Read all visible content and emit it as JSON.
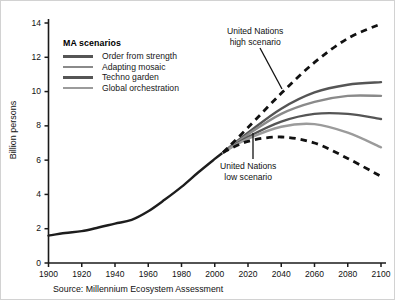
{
  "chart_data": {
    "type": "line",
    "title": "",
    "xlabel": "",
    "ylabel": "Billion persons",
    "xlim": [
      1900,
      2100
    ],
    "ylim": [
      0,
      14
    ],
    "xticks": [
      1900,
      1920,
      1940,
      1960,
      1980,
      2000,
      2020,
      2040,
      2060,
      2080,
      2100
    ],
    "yticks": [
      0,
      2,
      4,
      6,
      8,
      10,
      12,
      14
    ],
    "grid": false,
    "legend_position": "top-left",
    "legend_title": "MA scenarios",
    "source": "Source: Millennium Ecosystem Assessment",
    "annotations": [
      {
        "text_line1": "United Nations",
        "text_line2": "high scenario",
        "points_to_year": 2030,
        "points_to_value": 8.6
      },
      {
        "text_line1": "United Nations",
        "text_line2": "low scenario",
        "points_to_year": 2022,
        "points_to_value": 7.4
      }
    ],
    "series": [
      {
        "name": "Historical",
        "color": "#1d1d1d",
        "style": "solid",
        "width": 2.4,
        "in_legend": false,
        "x": [
          1900,
          1910,
          1920,
          1930,
          1940,
          1950,
          1960,
          1970,
          1980,
          1990,
          2000,
          2005
        ],
        "values": [
          1.6,
          1.75,
          1.86,
          2.07,
          2.3,
          2.52,
          3.02,
          3.7,
          4.44,
          5.28,
          6.07,
          6.45
        ]
      },
      {
        "name": "Order from strength",
        "color": "#555555",
        "style": "solid",
        "width": 2.4,
        "in_legend": true,
        "x": [
          2005,
          2020,
          2040,
          2060,
          2080,
          2100
        ],
        "values": [
          6.45,
          7.6,
          9.0,
          9.95,
          10.4,
          10.55
        ]
      },
      {
        "name": "Adapting mosaic",
        "color": "#8a8a8a",
        "style": "solid",
        "width": 2.4,
        "in_legend": true,
        "x": [
          2005,
          2020,
          2040,
          2060,
          2080,
          2100
        ],
        "values": [
          6.45,
          7.5,
          8.7,
          9.4,
          9.75,
          9.75
        ]
      },
      {
        "name": "Techno garden",
        "color": "#555555",
        "style": "solid",
        "width": 2.4,
        "in_legend": true,
        "x": [
          2005,
          2020,
          2040,
          2060,
          2080,
          2100
        ],
        "values": [
          6.45,
          7.35,
          8.25,
          8.7,
          8.7,
          8.4
        ]
      },
      {
        "name": "Global orchestration",
        "color": "#9b9b9b",
        "style": "solid",
        "width": 2.4,
        "in_legend": true,
        "x": [
          2005,
          2020,
          2040,
          2060,
          2080,
          2100
        ],
        "values": [
          6.45,
          7.25,
          7.95,
          8.1,
          7.6,
          6.75
        ]
      },
      {
        "name": "United Nations high scenario",
        "color": "#111111",
        "style": "dashed",
        "width": 2.8,
        "in_legend": false,
        "x": [
          2005,
          2020,
          2040,
          2060,
          2080,
          2100
        ],
        "values": [
          6.45,
          7.9,
          9.9,
          11.7,
          13.1,
          13.95
        ]
      },
      {
        "name": "United Nations low scenario",
        "color": "#111111",
        "style": "dashed",
        "width": 2.8,
        "in_legend": false,
        "x": [
          2005,
          2020,
          2040,
          2060,
          2080,
          2100
        ],
        "values": [
          6.45,
          7.1,
          7.35,
          7.0,
          6.1,
          5.05
        ]
      }
    ]
  },
  "axes": {
    "ylabel": "Billion persons",
    "yticks": [
      "0",
      "2",
      "4",
      "6",
      "8",
      "10",
      "12",
      "14"
    ],
    "xticks": [
      "1900",
      "1920",
      "1940",
      "1960",
      "1980",
      "2000",
      "2020",
      "2040",
      "2060",
      "2080",
      "2100"
    ]
  },
  "legend": {
    "title": "MA scenarios",
    "items": [
      {
        "label": "Order from strength",
        "color": "#555555"
      },
      {
        "label": "Adapting mosaic",
        "color": "#8a8a8a"
      },
      {
        "label": "Techno garden",
        "color": "#555555"
      },
      {
        "label": "Global orchestration",
        "color": "#9b9b9b"
      }
    ]
  },
  "annotations": {
    "high": {
      "line1": "United Nations",
      "line2": "high scenario"
    },
    "low": {
      "line1": "United Nations",
      "line2": "low scenario"
    }
  },
  "footer": {
    "source": "Source: Millennium Ecosystem Assessment"
  }
}
